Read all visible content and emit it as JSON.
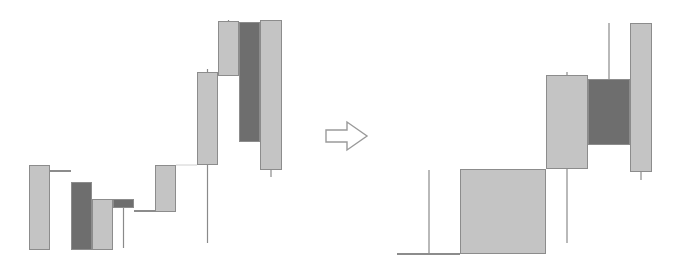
{
  "colors": {
    "up_fill": "#c4c4c4",
    "down_fill": "#6e6e6e",
    "border": "#8c8c8c",
    "wick": "#8a8a8a",
    "arrow_stroke": "#9a9a9a",
    "background": "#ffffff"
  },
  "chart_data": [
    {
      "type": "candlestick",
      "title": "",
      "xlabel": "",
      "ylabel": "",
      "grid": false,
      "legend": null,
      "note": "Left panel: sequence of 11 candles (pixel coords, y grows downward)",
      "candles": [
        {
          "x": 29,
          "w": 21,
          "top": 165,
          "bottom": 250,
          "dir": "up",
          "wick_top": 165,
          "wick_bottom": 250
        },
        {
          "x": 50,
          "w": 21,
          "top": 170,
          "bottom": 172,
          "dir": "down",
          "wick_top": 170,
          "wick_bottom": 172
        },
        {
          "x": 71,
          "w": 21,
          "top": 182,
          "bottom": 250,
          "dir": "down",
          "wick_top": 182,
          "wick_bottom": 250
        },
        {
          "x": 92,
          "w": 21,
          "top": 199,
          "bottom": 250,
          "dir": "up",
          "wick_top": 199,
          "wick_bottom": 250
        },
        {
          "x": 113,
          "w": 21,
          "top": 199,
          "bottom": 208,
          "dir": "down",
          "wick_top": 199,
          "wick_bottom": 248
        },
        {
          "x": 134,
          "w": 21,
          "top": 210,
          "bottom": 212,
          "dir": "down",
          "wick_top": 210,
          "wick_bottom": 212
        },
        {
          "x": 155,
          "w": 21,
          "top": 165,
          "bottom": 212,
          "dir": "up",
          "wick_top": 165,
          "wick_bottom": 212
        },
        {
          "x": 197,
          "w": 21,
          "top": 72,
          "bottom": 165,
          "dir": "up",
          "wick_top": 69,
          "wick_bottom": 243
        },
        {
          "x": 218,
          "w": 21,
          "top": 21,
          "bottom": 76,
          "dir": "up",
          "wick_top": 20,
          "wick_bottom": 76
        },
        {
          "x": 239,
          "w": 21,
          "top": 22,
          "bottom": 142,
          "dir": "down",
          "wick_top": 22,
          "wick_bottom": 142
        },
        {
          "x": 260,
          "w": 22,
          "top": 20,
          "bottom": 170,
          "dir": "up",
          "wick_top": 20,
          "wick_bottom": 177
        }
      ],
      "connector": {
        "x1": 176,
        "x2": 197,
        "y": 165
      }
    },
    {
      "type": "candlestick",
      "title": "",
      "xlabel": "",
      "ylabel": "",
      "grid": false,
      "legend": null,
      "note": "Right panel: same data after transformation (merged/resized candles)",
      "candles": [
        {
          "x": 397,
          "w": 63,
          "top": 253,
          "bottom": 255,
          "dir": "down",
          "wick_top": 170,
          "wick_bottom": 254,
          "wick_x": 429
        },
        {
          "x": 460,
          "w": 86,
          "top": 169,
          "bottom": 254,
          "dir": "up",
          "wick_top": 169,
          "wick_bottom": 254,
          "wick_x": 503
        },
        {
          "x": 546,
          "w": 42,
          "top": 75,
          "bottom": 169,
          "dir": "up",
          "wick_top": 72,
          "wick_bottom": 243,
          "wick_x": 567
        },
        {
          "x": 588,
          "w": 42,
          "top": 79,
          "bottom": 145,
          "dir": "down",
          "wick_top": 23,
          "wick_bottom": 145,
          "wick_x": 609
        },
        {
          "x": 630,
          "w": 22,
          "top": 23,
          "bottom": 172,
          "dir": "up",
          "wick_top": 23,
          "wick_bottom": 180,
          "wick_x": 641
        }
      ]
    }
  ],
  "arrow": {
    "direction": "right",
    "icon": "hollow-right-arrow"
  }
}
